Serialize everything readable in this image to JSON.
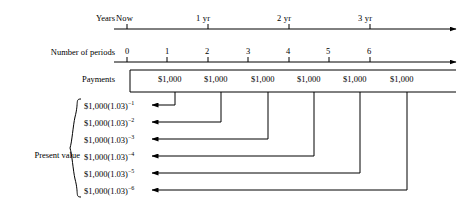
{
  "diagram": {
    "rows": {
      "years_label": "Years",
      "periods_label": "Number of periods",
      "payments_label": "Payments",
      "present_value_label": "Present value"
    },
    "year_ticks": [
      {
        "label": "Now",
        "x": 127
      },
      {
        "label": "1 yr",
        "x": 206
      },
      {
        "label": "2 yr",
        "x": 287
      },
      {
        "label": "3 yr",
        "x": 368
      }
    ],
    "periods": [
      "0",
      "1",
      "2",
      "3",
      "4",
      "5",
      "6"
    ],
    "payments": [
      "$1,000",
      "$1,000",
      "$1,000",
      "$1,000",
      "$1,000",
      "$1,000"
    ],
    "present_values": [
      "$1,000(1.03)",
      "$1,000(1.03)",
      "$1,000(1.03)",
      "$1,000(1.03)",
      "$1,000(1.03)",
      "$1,000(1.03)"
    ],
    "present_value_exponents": [
      "−1",
      "−2",
      "−3",
      "−4",
      "−5",
      "−6"
    ],
    "footer": "",
    "colors": {
      "ink": "#000000",
      "background": "#ffffff"
    }
  }
}
